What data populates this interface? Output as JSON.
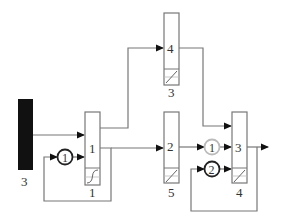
{
  "diagram": {
    "type": "block-flow-diagram",
    "colors": {
      "line": "#777777",
      "box_border": "#777777",
      "source_bar": "#111111",
      "circle_dark": "#222222",
      "circle_light": "#bbbbbb",
      "arrow": "#111111",
      "text": "#333333"
    },
    "source": {
      "label_below": "3"
    },
    "blocks": [
      {
        "id": "block-1",
        "inner_label": "1",
        "label_below": "1"
      },
      {
        "id": "block-4",
        "inner_label": "4",
        "label_below": "3"
      },
      {
        "id": "block-2",
        "inner_label": "2",
        "label_below": "5"
      },
      {
        "id": "block-3",
        "inner_label": "3",
        "label_below": "4"
      }
    ],
    "circles": [
      {
        "id": "circle-left-1",
        "label": "1",
        "style": "dark"
      },
      {
        "id": "circle-right-1",
        "label": "1",
        "style": "light"
      },
      {
        "id": "circle-right-2",
        "label": "2",
        "style": "dark"
      }
    ],
    "connections": [
      "source -> block-1 (upper input)",
      "circle-left-1 -> block-1 (lower input)",
      "block-1 output -> block-4",
      "block-1 output -> block-2",
      "block-1 output -> feedback -> circle-left-1",
      "block-4 -> block-3 (top input)",
      "block-2 -> circle-right-1 -> block-3",
      "circle-right-2 -> block-3 (lower input)",
      "block-3 output -> exit arrow",
      "block-3 output -> feedback -> circle-right-2"
    ]
  }
}
